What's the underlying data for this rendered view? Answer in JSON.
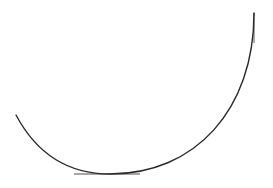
{
  "diagram": {
    "curve": {
      "path": "M16,115 C40,160 75,174 110,174 C195,174 254,110 254,13",
      "color": "#2a2a2a",
      "width": 1.4
    },
    "tangent_bottom": {
      "x1": 74,
      "y1": 174,
      "x2": 140,
      "y2": 174,
      "color": "#888888"
    },
    "tangent_right": {
      "x1": 254,
      "y1": 13,
      "x2": 254,
      "y2": 43,
      "color": "#888888"
    }
  }
}
